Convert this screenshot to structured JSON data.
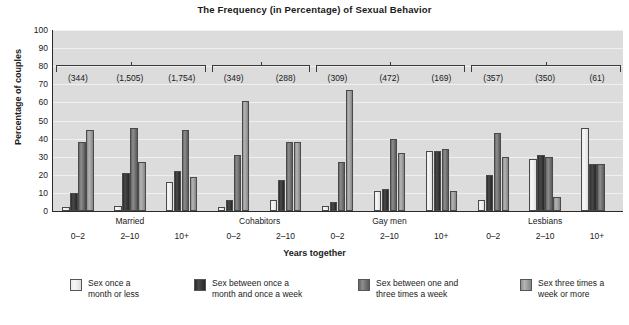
{
  "chart_data": {
    "type": "bar",
    "title": "The Frequency (in Percentage) of Sexual Behavior",
    "xlabel": "Years together",
    "ylabel": "Percentage of couples",
    "ylim": [
      0,
      100
    ],
    "ytick_step": 10,
    "yticks": [
      "100",
      "90",
      "80",
      "70",
      "60",
      "50",
      "40",
      "30",
      "20",
      "10",
      "0"
    ],
    "grid": true,
    "legend_position": "bottom",
    "categories": [
      "0–2",
      "2–10",
      "10+",
      "0–2",
      "2–10",
      "0–2",
      "2–10",
      "10+",
      "0–2",
      "2–10",
      "10+"
    ],
    "group_labels": [
      "Married",
      "Cohabitors",
      "Gay men",
      "Lesbians"
    ],
    "group_spans": [
      3,
      2,
      3,
      3
    ],
    "sample_sizes": [
      "(344)",
      "(1,505)",
      "(1,754)",
      "(349)",
      "(288)",
      "(309)",
      "(472)",
      "(169)",
      "(357)",
      "(350)",
      "(61)"
    ],
    "series": [
      {
        "name": "Sex once a\nmonth or less",
        "color": "#efefef",
        "values": [
          2,
          3,
          16,
          2,
          6,
          3,
          11,
          33,
          6,
          29,
          46
        ]
      },
      {
        "name": "Sex between once a\nmonth and once a week",
        "color": "#333333",
        "values": [
          10,
          21,
          22,
          6,
          17,
          5,
          12,
          33,
          20,
          31,
          26
        ]
      },
      {
        "name": "Sex between one and\nthree times a week",
        "color": "#7a7a7a",
        "values": [
          38,
          46,
          45,
          31,
          38,
          27,
          40,
          34,
          43,
          30,
          26
        ]
      },
      {
        "name": "Sex three times a\nweek or more",
        "color": "#a8a8a8",
        "values": [
          45,
          27,
          19,
          61,
          38,
          67,
          32,
          11,
          30,
          8,
          0
        ]
      }
    ]
  },
  "legend": [
    {
      "label": "Sex once a\nmonth or less",
      "swatch": "series-0-swatch"
    },
    {
      "label": "Sex between once a\nmonth and once a week",
      "swatch": "series-1-swatch"
    },
    {
      "label": "Sex between one and\nthree times a week",
      "swatch": "series-2-swatch"
    },
    {
      "label": "Sex three times a\nweek or more",
      "swatch": "series-3-swatch"
    }
  ]
}
